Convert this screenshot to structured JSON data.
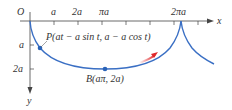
{
  "figure": {
    "origin_label": "O",
    "x_axis_label": "x",
    "y_axis_label": "y",
    "x_tick_labels": [
      "a",
      "2a",
      "πa",
      "2πa"
    ],
    "y_tick_labels": [
      "a",
      "2a"
    ],
    "point_p_label": "P(at − a sin t, a − a cos t)",
    "point_b_label": "B(aπ, 2a)",
    "colors": {
      "curve": "#3a6fc4",
      "axis": "#333333",
      "motion_arrow": "#e0282a",
      "point": "#2a63b8"
    }
  }
}
